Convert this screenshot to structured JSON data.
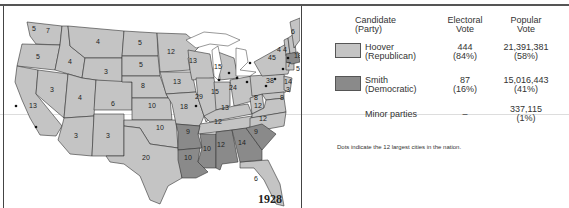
{
  "map": {
    "year": "1928",
    "colors": {
      "republican": "#c4c4c4",
      "democratic": "#8a8a8a",
      "border": "#333333",
      "water": "#ffffff"
    },
    "state_labels": [
      {
        "abbr": "WA",
        "ev": "7",
        "party": "R"
      },
      {
        "abbr": "WA-city",
        "ev": "6"
      },
      {
        "abbr": "OR",
        "ev": "5",
        "party": "R"
      },
      {
        "abbr": "ID",
        "ev": "4",
        "party": "R"
      },
      {
        "abbr": "MT",
        "ev": "4",
        "party": "R"
      },
      {
        "abbr": "CA",
        "ev": "13",
        "party": "R"
      },
      {
        "abbr": "NV",
        "ev": "3",
        "party": "R"
      },
      {
        "abbr": "UT",
        "ev": "4",
        "party": "R"
      },
      {
        "abbr": "WY",
        "ev": "3",
        "party": "R"
      },
      {
        "abbr": "CO",
        "ev": "6",
        "party": "R"
      },
      {
        "abbr": "AZ",
        "ev": "3",
        "party": "R"
      },
      {
        "abbr": "NM",
        "ev": "3",
        "party": "R"
      },
      {
        "abbr": "ND",
        "ev": "5",
        "party": "R"
      },
      {
        "abbr": "SD",
        "ev": "5",
        "party": "R"
      },
      {
        "abbr": "NE",
        "ev": "8",
        "party": "R"
      },
      {
        "abbr": "KS",
        "ev": "10",
        "party": "R"
      },
      {
        "abbr": "OK",
        "ev": "10",
        "party": "R"
      },
      {
        "abbr": "TX",
        "ev": "20",
        "party": "R"
      },
      {
        "abbr": "MN",
        "ev": "12",
        "party": "R"
      },
      {
        "abbr": "IA",
        "ev": "13",
        "party": "R"
      },
      {
        "abbr": "MO",
        "ev": "18",
        "party": "R"
      },
      {
        "abbr": "AR",
        "ev": "9",
        "party": "D"
      },
      {
        "abbr": "LA",
        "ev": "10",
        "party": "D"
      },
      {
        "abbr": "WI",
        "ev": "13",
        "party": "R"
      },
      {
        "abbr": "IL",
        "ev": "29",
        "party": "R"
      },
      {
        "abbr": "MI",
        "ev": "15",
        "party": "R"
      },
      {
        "abbr": "IN",
        "ev": "15",
        "party": "R"
      },
      {
        "abbr": "OH",
        "ev": "24",
        "party": "R"
      },
      {
        "abbr": "KY",
        "ev": "13",
        "party": "R"
      },
      {
        "abbr": "TN",
        "ev": "12",
        "party": "R"
      },
      {
        "abbr": "MS",
        "ev": "10",
        "party": "D"
      },
      {
        "abbr": "AL",
        "ev": "12",
        "party": "D"
      },
      {
        "abbr": "GA",
        "ev": "14",
        "party": "D"
      },
      {
        "abbr": "FL",
        "ev": "6",
        "party": "R"
      },
      {
        "abbr": "SC",
        "ev": "9",
        "party": "D"
      },
      {
        "abbr": "NC",
        "ev": "12",
        "party": "R"
      },
      {
        "abbr": "VA",
        "ev": "12",
        "party": "R"
      },
      {
        "abbr": "WV",
        "ev": "8",
        "party": "R"
      },
      {
        "abbr": "PA",
        "ev": "38",
        "party": "R"
      },
      {
        "abbr": "NY",
        "ev": "45",
        "party": "R"
      },
      {
        "abbr": "VT",
        "ev": "4",
        "party": "R"
      },
      {
        "abbr": "NH",
        "ev": "4",
        "party": "R"
      },
      {
        "abbr": "ME",
        "ev": "6",
        "party": "R"
      },
      {
        "abbr": "MA",
        "ev": "18",
        "party": "D"
      },
      {
        "abbr": "RI",
        "ev": "5",
        "party": "D"
      },
      {
        "abbr": "CT",
        "ev": "7",
        "party": "R"
      },
      {
        "abbr": "NJ",
        "ev": "14",
        "party": "R"
      },
      {
        "abbr": "DE",
        "ev": "3",
        "party": "R"
      },
      {
        "abbr": "MD",
        "ev": "8",
        "party": "R"
      }
    ]
  },
  "legend": {
    "headers": {
      "candidate": [
        "Candidate",
        "(Party)"
      ],
      "electoral": [
        "Electoral",
        "Vote"
      ],
      "popular": [
        "Popular",
        "Vote"
      ]
    },
    "rows": [
      {
        "name": "Hoover",
        "party": "(Republican)",
        "ev": "444",
        "ev_pct": "(84%)",
        "pv": "21,391,381",
        "pv_pct": "(58%)",
        "color": "#c4c4c4"
      },
      {
        "name": "Smith",
        "party": "(Democratic)",
        "ev": "87",
        "ev_pct": "(16%)",
        "pv": "15,016,443",
        "pv_pct": "(41%)",
        "color": "#8a8a8a"
      },
      {
        "name": "Minor parties",
        "party": "",
        "ev": "–",
        "ev_pct": "",
        "pv": "337,115",
        "pv_pct": "(1%)"
      }
    ],
    "note": "Dots indicate the 12 largest cities in the nation."
  }
}
